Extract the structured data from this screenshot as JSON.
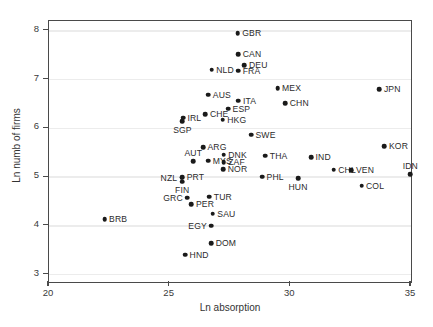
{
  "figure": {
    "width": 433,
    "height": 327,
    "background": "#ffffff",
    "frame_color": "#4a4a4a",
    "grid_color": "#ececec",
    "point_color": "#1a1a1a"
  },
  "chart_data": {
    "type": "scatter",
    "title": "",
    "xlabel": "Ln absorption",
    "ylabel": "Ln numb of firms",
    "xlim": [
      20,
      35
    ],
    "ylim": [
      2.85,
      8.2
    ],
    "xticks": [
      20,
      25,
      30,
      35
    ],
    "yticks": [
      3,
      4,
      5,
      6,
      7,
      8
    ],
    "grid": true,
    "grid_axis": "y",
    "legend": "none",
    "point_label_field": "label",
    "points": [
      {
        "label": "GBR",
        "x": 27.82,
        "y": 7.95,
        "lpos": "right"
      },
      {
        "label": "CAN",
        "x": 27.84,
        "y": 7.52,
        "lpos": "right"
      },
      {
        "label": "DEU",
        "x": 28.1,
        "y": 7.3,
        "lpos": "right"
      },
      {
        "label": "NLD",
        "x": 26.74,
        "y": 7.2,
        "lpos": "right"
      },
      {
        "label": "FRA",
        "x": 27.84,
        "y": 7.18,
        "lpos": "right"
      },
      {
        "label": "MEX",
        "x": 29.47,
        "y": 6.82,
        "lpos": "right"
      },
      {
        "label": "JPN",
        "x": 33.69,
        "y": 6.8,
        "lpos": "right"
      },
      {
        "label": "AUS",
        "x": 26.6,
        "y": 6.69,
        "lpos": "right"
      },
      {
        "label": "ITA",
        "x": 27.85,
        "y": 6.57,
        "lpos": "right"
      },
      {
        "label": "CHN",
        "x": 29.79,
        "y": 6.51,
        "lpos": "right"
      },
      {
        "label": "ESP",
        "x": 27.42,
        "y": 6.4,
        "lpos": "right"
      },
      {
        "label": "CHE",
        "x": 26.48,
        "y": 6.29,
        "lpos": "right"
      },
      {
        "label": "IRL",
        "x": 25.55,
        "y": 6.22,
        "lpos": "right"
      },
      {
        "label": "HKG",
        "x": 27.2,
        "y": 6.18,
        "lpos": "right"
      },
      {
        "label": "SGP",
        "x": 25.53,
        "y": 6.14,
        "lpos": "below"
      },
      {
        "label": "SWE",
        "x": 28.37,
        "y": 5.87,
        "lpos": "right"
      },
      {
        "label": "KOR",
        "x": 33.9,
        "y": 5.63,
        "lpos": "right"
      },
      {
        "label": "ARG",
        "x": 26.38,
        "y": 5.61,
        "lpos": "right"
      },
      {
        "label": "DNK",
        "x": 27.24,
        "y": 5.46,
        "lpos": "right"
      },
      {
        "label": "THA",
        "x": 28.96,
        "y": 5.44,
        "lpos": "right"
      },
      {
        "label": "IND",
        "x": 30.86,
        "y": 5.41,
        "lpos": "right"
      },
      {
        "label": "MYS",
        "x": 26.6,
        "y": 5.34,
        "lpos": "right"
      },
      {
        "label": "AUT",
        "x": 25.98,
        "y": 5.33,
        "lpos": "above"
      },
      {
        "label": "ZAF",
        "x": 27.24,
        "y": 5.31,
        "lpos": "right"
      },
      {
        "label": "NOR",
        "x": 27.22,
        "y": 5.16,
        "lpos": "right"
      },
      {
        "label": "CHL",
        "x": 31.8,
        "y": 5.15,
        "lpos": "right"
      },
      {
        "label": "VEN",
        "x": 32.53,
        "y": 5.14,
        "lpos": "right"
      },
      {
        "label": "IDN",
        "x": 34.97,
        "y": 5.06,
        "lpos": "above"
      },
      {
        "label": "PHL",
        "x": 28.83,
        "y": 5.01,
        "lpos": "right"
      },
      {
        "label": "PRT",
        "x": 25.52,
        "y": 5.0,
        "lpos": "right"
      },
      {
        "label": "NZL",
        "x": 25.5,
        "y": 4.99,
        "lpos": "left"
      },
      {
        "label": "HUN",
        "x": 30.32,
        "y": 4.98,
        "lpos": "below"
      },
      {
        "label": "FIN",
        "x": 25.52,
        "y": 4.91,
        "lpos": "below"
      },
      {
        "label": "COL",
        "x": 32.95,
        "y": 4.82,
        "lpos": "right"
      },
      {
        "label": "TUR",
        "x": 26.64,
        "y": 4.6,
        "lpos": "right"
      },
      {
        "label": "GRC",
        "x": 25.73,
        "y": 4.58,
        "lpos": "left"
      },
      {
        "label": "PER",
        "x": 25.9,
        "y": 4.44,
        "lpos": "right"
      },
      {
        "label": "SAU",
        "x": 26.79,
        "y": 4.25,
        "lpos": "right"
      },
      {
        "label": "BRB",
        "x": 22.3,
        "y": 4.14,
        "lpos": "right"
      },
      {
        "label": "EGY",
        "x": 26.73,
        "y": 4.0,
        "lpos": "left"
      },
      {
        "label": "DOM",
        "x": 26.72,
        "y": 3.65,
        "lpos": "right"
      },
      {
        "label": "HND",
        "x": 25.64,
        "y": 3.41,
        "lpos": "right"
      }
    ]
  }
}
